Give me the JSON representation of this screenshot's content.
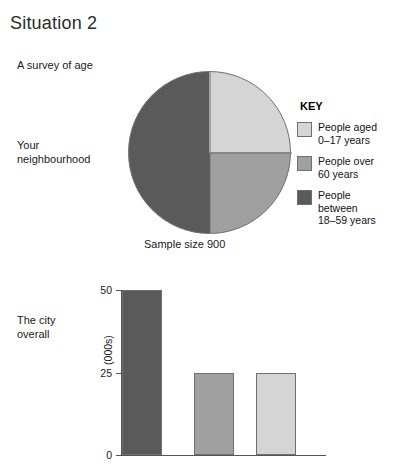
{
  "page_title": "Situation 2",
  "labels": {
    "survey": "A survey of age",
    "neighbourhood": "Your\nneighbourhood",
    "neighbourhood_line1": "Your",
    "neighbourhood_line2": "neighbourhood",
    "city_line1": "The city",
    "city_line2": "overall"
  },
  "colors": {
    "light_gray": "#d5d5d5",
    "medium_gray": "#a0a0a0",
    "dark_gray": "#5a5a5a",
    "outline": "#6f6f6f",
    "axis": "#555555"
  },
  "legend": {
    "title": "KEY",
    "items": [
      {
        "label_line1": "People aged",
        "label_line2": "0–17 years",
        "color": "#d5d5d5",
        "swatch_name": "legend-swatch-aged-0-17"
      },
      {
        "label_line1": "People over",
        "label_line2": "60 years",
        "color": "#a0a0a0",
        "swatch_name": "legend-swatch-over-60"
      },
      {
        "label_line1": "People between",
        "label_line2": "18–59 years",
        "color": "#5a5a5a",
        "swatch_name": "legend-swatch-between-18-59"
      }
    ]
  },
  "pie_caption": "Sample size 900",
  "chart_data": [
    {
      "type": "pie",
      "title": "A survey of age",
      "subtitle": "Your neighbourhood",
      "annotations": [
        "Sample size 900"
      ],
      "sample_size": 900,
      "categories": [
        "People aged 0–17 years",
        "People over 60 years",
        "People between 18–59 years"
      ],
      "values": [
        25,
        25,
        50
      ],
      "value_unit": "percent",
      "colors": [
        "#d5d5d5",
        "#a0a0a0",
        "#5a5a5a"
      ],
      "start_angle_deg": 0,
      "direction": "clockwise",
      "legend_position": "right"
    },
    {
      "type": "bar",
      "title": "The city overall",
      "categories": [
        "People between 18–59 years",
        "People over 60 years",
        "People aged 0–17 years"
      ],
      "values": [
        50,
        25,
        25
      ],
      "colors": [
        "#5a5a5a",
        "#a0a0a0",
        "#d5d5d5"
      ],
      "xlabel": "",
      "ylabel": "(000s)",
      "ylim": [
        0,
        50
      ],
      "yticks": [
        0,
        25,
        50
      ],
      "ytick_labels": [
        "0",
        "25",
        "50"
      ],
      "grid": false,
      "legend_position": "none"
    }
  ]
}
